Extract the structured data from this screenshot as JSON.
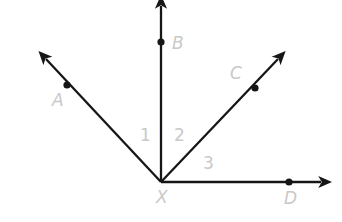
{
  "figure": {
    "background_color": "#ffffff",
    "ray_color": "#161616",
    "label_color": "#c9c9c9",
    "vertex": {
      "name": "X",
      "label": "X",
      "x": 161,
      "y": 182,
      "label_x": 156,
      "label_y": 203
    },
    "rays": [
      {
        "id": "ray-xa",
        "label": "A",
        "from_x": 161,
        "from_y": 182,
        "to_x": 46,
        "to_y": 59,
        "point_x": 67,
        "point_y": 85,
        "label_x": 52,
        "label_y": 106
      },
      {
        "id": "ray-xb",
        "label": "B",
        "from_x": 161,
        "from_y": 182,
        "to_x": 161,
        "to_y": 6,
        "point_x": 161,
        "point_y": 42,
        "label_x": 172,
        "label_y": 49
      },
      {
        "id": "ray-xc",
        "label": "C",
        "from_x": 161,
        "from_y": 182,
        "to_x": 278,
        "to_y": 59,
        "point_x": 255,
        "point_y": 88,
        "label_x": 230,
        "label_y": 79
      },
      {
        "id": "ray-xd",
        "label": "D",
        "from_x": 161,
        "from_y": 182,
        "to_x": 321,
        "to_y": 182,
        "point_x": 289,
        "point_y": 182,
        "label_x": 284,
        "label_y": 204
      }
    ],
    "angles": [
      {
        "id": "angle-1",
        "label": "1",
        "between": "ray-xa and ray-xb",
        "label_x": 140,
        "label_y": 141
      },
      {
        "id": "angle-2",
        "label": "2",
        "between": "ray-xb and ray-xc",
        "label_x": 174,
        "label_y": 141
      },
      {
        "id": "angle-3",
        "label": "3",
        "between": "ray-xc and ray-xd",
        "label_x": 203,
        "label_y": 169
      }
    ]
  }
}
